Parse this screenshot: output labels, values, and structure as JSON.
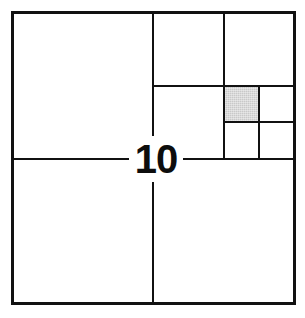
{
  "figure": {
    "label": "10",
    "kind": "recursive-square-subdivision-diagram",
    "background_color": "#ffffff",
    "line_color": "#111111",
    "shade_color": "#c9c9c9",
    "canvas": {
      "width": 305,
      "height": 318
    },
    "outer_square": {
      "x": 11,
      "y": 11,
      "width": 285,
      "height": 294
    },
    "shaded_cell": {
      "x": 224,
      "y": 86,
      "width": 35,
      "height": 36
    },
    "lines": [
      {
        "name": "outer-top",
        "orientation": "horizontal",
        "x": 11,
        "y": 11,
        "length": 285,
        "thickness": 3
      },
      {
        "name": "outer-bottom",
        "orientation": "horizontal",
        "x": 11,
        "y": 302,
        "length": 285,
        "thickness": 3
      },
      {
        "name": "outer-left",
        "orientation": "vertical",
        "x": 11,
        "y": 11,
        "length": 294,
        "thickness": 3
      },
      {
        "name": "outer-right",
        "orientation": "vertical",
        "x": 293,
        "y": 11,
        "length": 294,
        "thickness": 3
      },
      {
        "name": "mid-vertical-upper",
        "orientation": "vertical",
        "x": 152,
        "y": 11,
        "length": 148,
        "thickness": 2
      },
      {
        "name": "mid-vertical-lower",
        "orientation": "vertical",
        "x": 152,
        "y": 159,
        "length": 146,
        "thickness": 2
      },
      {
        "name": "mid-horizontal-left",
        "orientation": "horizontal",
        "x": 11,
        "y": 158,
        "length": 121,
        "thickness": 2
      },
      {
        "name": "mid-horizontal-right",
        "orientation": "horizontal",
        "x": 181,
        "y": 158,
        "length": 115,
        "thickness": 2
      },
      {
        "name": "quarter-vertical",
        "orientation": "vertical",
        "x": 223,
        "y": 11,
        "length": 148,
        "thickness": 2
      },
      {
        "name": "quarter-horizontal",
        "orientation": "horizontal",
        "x": 152,
        "y": 85,
        "length": 144,
        "thickness": 2
      },
      {
        "name": "eighth-vertical",
        "orientation": "vertical",
        "x": 258,
        "y": 85,
        "length": 74,
        "thickness": 2
      },
      {
        "name": "eighth-horizontal",
        "orientation": "horizontal",
        "x": 223,
        "y": 121,
        "length": 73,
        "thickness": 2
      }
    ]
  },
  "regions": [
    {
      "name": "region-upper-left-quadrant",
      "shaded": false
    },
    {
      "name": "region-lower-left-quadrant",
      "shaded": false
    },
    {
      "name": "region-lower-right-quadrant",
      "shaded": false
    },
    {
      "name": "region-upper-right-upper-left",
      "shaded": false
    },
    {
      "name": "region-upper-right-upper-right",
      "shaded": false
    },
    {
      "name": "region-upper-right-lower-left",
      "shaded": false
    },
    {
      "name": "region-eighth-shaded",
      "shaded": true
    },
    {
      "name": "region-eighth-right",
      "shaded": false
    },
    {
      "name": "region-sixteenth-lower-left",
      "shaded": false
    },
    {
      "name": "region-sixteenth-lower-right",
      "shaded": false
    }
  ]
}
